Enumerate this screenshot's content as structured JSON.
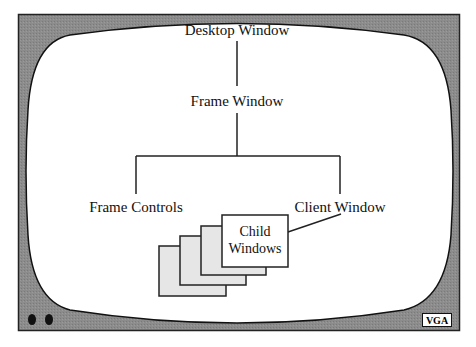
{
  "diagram": {
    "root": {
      "label": "Desktop Window"
    },
    "frame": {
      "label": "Frame Window"
    },
    "children": [
      {
        "label": "Frame Controls"
      },
      {
        "label": "Client Window"
      }
    ],
    "child_windows": {
      "label_line1": "Child",
      "label_line2": "Windows",
      "stack_count": 4
    }
  },
  "monitor": {
    "badge": "VGA",
    "buttons": 2,
    "colors": {
      "bezel": "#8a8a8a",
      "screen": "#ffffff",
      "outline": "#111111",
      "child_fill": "#e6e6e6"
    }
  }
}
